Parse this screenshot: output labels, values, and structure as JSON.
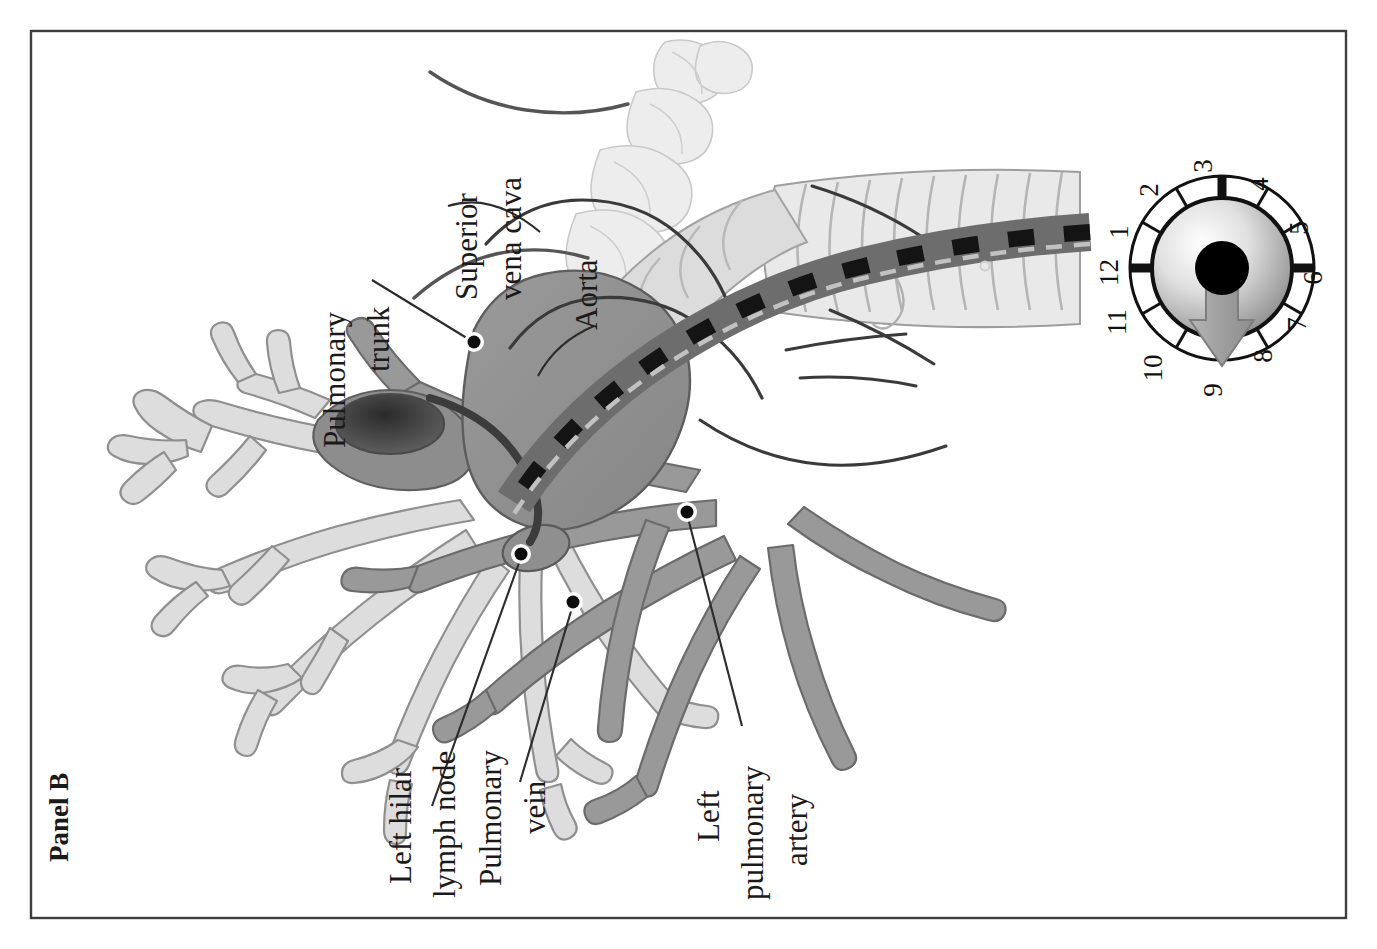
{
  "figure": {
    "panel_label": "Panel B",
    "border_color": "#3b3b3b",
    "background_color": "#ffffff"
  },
  "labels": [
    {
      "id": "superior-vena-cava",
      "lines": [
        "Superior",
        "vena cava"
      ],
      "text": "Superior vena cava"
    },
    {
      "id": "aorta",
      "lines": [
        "Aorta"
      ],
      "text": "Aorta"
    },
    {
      "id": "pulmonary-trunk",
      "lines": [
        "Pulmonary",
        "trunk"
      ],
      "text": "Pulmonary trunk"
    },
    {
      "id": "left-hilar-lymph-node",
      "lines": [
        "Left hilar",
        "lymph node"
      ],
      "text": "Left hilar lymph node"
    },
    {
      "id": "pulmonary-vein",
      "lines": [
        "Pulmonary",
        "vein"
      ],
      "text": "Pulmonary vein"
    },
    {
      "id": "left-pulmonary-artery",
      "lines": [
        "Left",
        "pulmonary",
        "artery"
      ],
      "text": "Left pulmonary artery"
    }
  ],
  "clock_dial": {
    "numbers": [
      "12",
      "1",
      "2",
      "3",
      "4",
      "5",
      "6",
      "7",
      "8",
      "9",
      "10",
      "11"
    ],
    "major_ticks": [
      "12",
      "3",
      "6",
      "9"
    ],
    "pointer_target": "9",
    "pointer_color": "#9a9a9a",
    "hub_color": "#000000",
    "face_gradient_from": "#fdfdfd",
    "face_gradient_to": "#8e8e8e"
  },
  "anatomy": {
    "colors": {
      "vessel_dark": "#8c8c8c",
      "vessel_mid": "#a2a2a2",
      "airway_light": "#d8d8d8",
      "airway_pale": "#e8e8e8",
      "bone_pale": "#e3e3e3",
      "scope_body": "#6e6e6e",
      "scope_marker": "#141414",
      "outline": "#4a4a4a"
    },
    "structures": [
      "trachea",
      "left main bronchus",
      "bronchial tree",
      "pulmonary trunk",
      "aorta",
      "superior vena cava",
      "left pulmonary artery",
      "pulmonary vein",
      "left hilar lymph node",
      "vertebral column",
      "bronchoscope"
    ]
  }
}
